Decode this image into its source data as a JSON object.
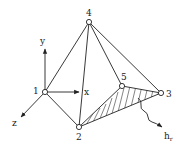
{
  "diagram": {
    "type": "tetrahedral-element",
    "nodes": [
      {
        "id": "1",
        "label": "1",
        "x": 45,
        "y": 92,
        "lx": 33,
        "ly": 93
      },
      {
        "id": "2",
        "label": "2",
        "x": 79,
        "y": 127,
        "lx": 76,
        "ly": 140
      },
      {
        "id": "3",
        "label": "3",
        "x": 161,
        "y": 93,
        "lx": 166,
        "ly": 97
      },
      {
        "id": "4",
        "label": "4",
        "x": 89,
        "y": 22,
        "lx": 86,
        "ly": 15
      },
      {
        "id": "5",
        "label": "5",
        "x": 122,
        "y": 86,
        "lx": 122,
        "ly": 79
      }
    ],
    "edges": [
      [
        "1",
        "4"
      ],
      [
        "1",
        "2"
      ],
      [
        "2",
        "4"
      ],
      [
        "4",
        "3"
      ],
      [
        "4",
        "5"
      ],
      [
        "2",
        "3"
      ],
      [
        "2",
        "5"
      ],
      [
        "5",
        "3"
      ]
    ],
    "axes": {
      "y": {
        "label": "y"
      },
      "x": {
        "label": "x"
      },
      "z": {
        "label": "z"
      }
    },
    "flux": {
      "label": "h",
      "subscript": "r"
    },
    "hatched_face": [
      "2",
      "5",
      "3"
    ]
  }
}
